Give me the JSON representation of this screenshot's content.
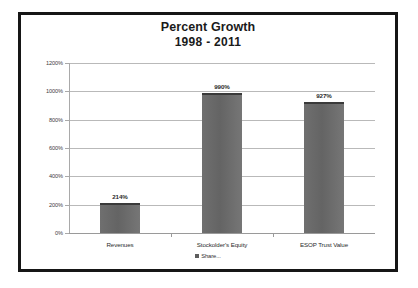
{
  "chart_data": {
    "type": "bar",
    "title": "Percent Growth",
    "subtitle": "1998 - 2011",
    "categories": [
      "Revenues",
      "Stockolder's Equity",
      "ESOP Trust Value"
    ],
    "values": [
      214,
      990,
      927
    ],
    "data_labels": [
      "214%",
      "990%",
      "927%"
    ],
    "xlabel": "",
    "ylabel": "",
    "ylim": [
      0,
      1200
    ],
    "ytick_values": [
      0,
      200,
      400,
      600,
      800,
      1000,
      1200
    ],
    "ytick_labels": [
      "0%",
      "200%",
      "400%",
      "600%",
      "800%",
      "1000%",
      "1200%"
    ],
    "grid": true,
    "legend_position": "bottom",
    "series": [
      {
        "name": "Share...",
        "values": [
          214,
          990,
          927
        ],
        "color": "#6a6a6a"
      }
    ],
    "colors": {
      "bar_fill": "#6a6a6a",
      "bar_top_edge": "#3a3a3a",
      "gridline": "#b9b9b9",
      "axis": "#9a9a9a",
      "frame_border": "#161616",
      "background": "#ffffff",
      "text": "#2b2b2b"
    }
  },
  "legend": {
    "swatch_icon": "legend-square-icon",
    "label": "Share..."
  }
}
